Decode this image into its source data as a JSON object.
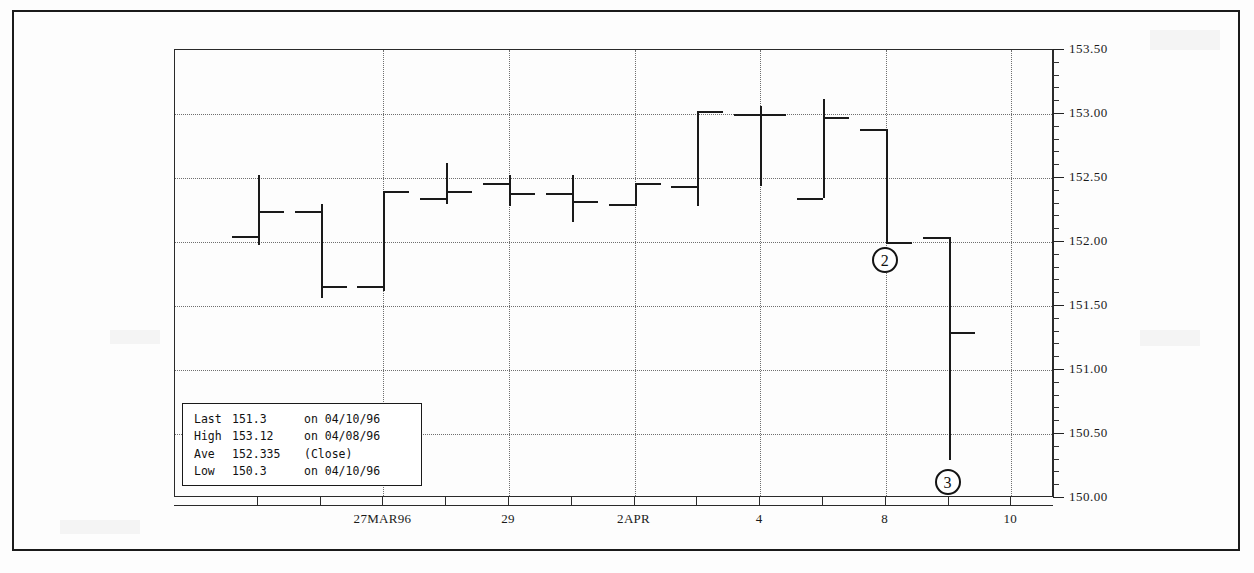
{
  "chart_data": {
    "type": "ohlc",
    "title": "",
    "xlabel": "",
    "ylabel": "",
    "ylim": [
      150.0,
      153.5
    ],
    "y_ticks": [
      "153.50",
      "153.00",
      "152.50",
      "152.00",
      "151.50",
      "151.00",
      "150.50",
      "150.00"
    ],
    "y_tick_values": [
      153.5,
      153.0,
      152.5,
      152.0,
      151.5,
      151.0,
      150.5,
      150.0
    ],
    "grid": true,
    "legend_position": "none",
    "x_tick_labels": [
      "27MAR96",
      "29",
      "2APR",
      "4",
      "8",
      "10"
    ],
    "x_tick_label_indices": [
      2,
      4,
      6,
      8,
      10,
      12
    ],
    "bars": [
      {
        "index": 0,
        "open": 152.05,
        "high": 152.52,
        "low": 151.98,
        "close": 152.24
      },
      {
        "index": 1,
        "open": 152.24,
        "high": 152.3,
        "low": 151.56,
        "close": 151.66
      },
      {
        "index": 2,
        "open": 151.66,
        "high": 152.4,
        "low": 151.62,
        "close": 152.4
      },
      {
        "index": 3,
        "open": 152.34,
        "high": 152.62,
        "low": 152.3,
        "close": 152.4
      },
      {
        "index": 4,
        "open": 152.46,
        "high": 152.52,
        "low": 152.28,
        "close": 152.38
      },
      {
        "index": 5,
        "open": 152.38,
        "high": 152.52,
        "low": 152.16,
        "close": 152.32
      },
      {
        "index": 6,
        "open": 152.3,
        "high": 152.46,
        "low": 152.28,
        "close": 152.46
      },
      {
        "index": 7,
        "open": 152.44,
        "high": 153.02,
        "low": 152.28,
        "close": 153.02
      },
      {
        "index": 8,
        "open": 153.0,
        "high": 153.06,
        "low": 152.44,
        "close": 153.0
      },
      {
        "index": 9,
        "open": 152.34,
        "high": 153.12,
        "low": 152.34,
        "close": 152.98
      },
      {
        "index": 10,
        "open": 152.88,
        "high": 152.88,
        "low": 152.0,
        "close": 152.0
      },
      {
        "index": 11,
        "open": 152.04,
        "high": 152.04,
        "low": 150.3,
        "close": 151.3
      }
    ],
    "stats": {
      "last_label": "Last",
      "last_value": "151.3",
      "last_note": "on 04/10/96",
      "high_label": "High",
      "high_value": "153.12",
      "high_note": "on 04/08/96",
      "ave_label": "Ave",
      "ave_value": "152.335",
      "ave_note": "(Close)",
      "low_label": "Low",
      "low_value": "150.3",
      "low_note": "on 04/10/96"
    },
    "annotations": [
      {
        "id": "annotation-2",
        "label": "2",
        "x_bar": 10,
        "y_value": 151.85
      },
      {
        "id": "annotation-3",
        "label": "3",
        "x_bar": 11,
        "y_value": 150.12
      }
    ],
    "colors": {
      "ink": "#1a1a1a",
      "grid": "#6f6f6f",
      "frame": "#2a2a2a",
      "background": "#ffffff"
    }
  }
}
